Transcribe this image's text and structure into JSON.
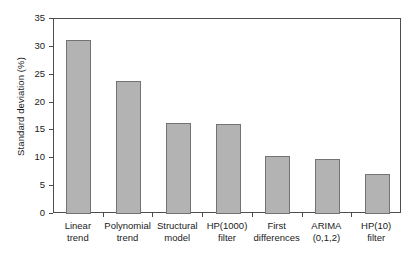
{
  "chart_data": {
    "type": "bar",
    "title": "",
    "subtitle": "",
    "xlabel": "",
    "ylabel": "Standard deviation (%)",
    "categories": [
      "Linear\ntrend",
      "Polynomial\ntrend",
      "Structural\nmodel",
      "HP(1000)\nfilter",
      "First\ndifferences",
      "ARIMA\n(0,1,2)",
      "HP(10)\nfilter"
    ],
    "category_lines": [
      [
        "Linear",
        "trend"
      ],
      [
        "Polynomial",
        "trend"
      ],
      [
        "Structural",
        "model"
      ],
      [
        "HP(1000)",
        "filter"
      ],
      [
        "First",
        "differences"
      ],
      [
        "ARIMA",
        "(0,1,2)"
      ],
      [
        "HP(10)",
        "filter"
      ]
    ],
    "values": [
      31.2,
      23.8,
      16.3,
      16.1,
      10.5,
      9.9,
      7.2
    ],
    "ylim": [
      0,
      35
    ],
    "yticks": [
      0,
      5,
      10,
      15,
      20,
      25,
      30,
      35
    ],
    "ytick_labels": [
      "0",
      "5",
      "10",
      "15",
      "20",
      "25",
      "30",
      "35"
    ],
    "grid": false,
    "legend": false,
    "legend_position": "none",
    "bar_fill_color": "#b3b3b3",
    "bar_edge_color": "#737373",
    "axis_color": "#4d4d4d",
    "text_color": "#1a1a1a",
    "background_color": "#ffffff"
  }
}
